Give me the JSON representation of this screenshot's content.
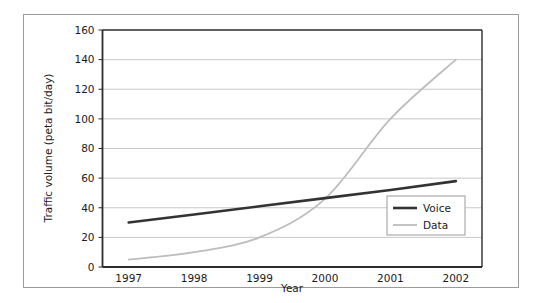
{
  "chart_data": {
    "type": "line",
    "title": "",
    "xlabel": "Year",
    "ylabel": "Traffic volume (peta bit/day)",
    "x": [
      1997,
      1998,
      1999,
      2000,
      2001,
      2002
    ],
    "xtick_labels": [
      "1997",
      "1998",
      "1999",
      "2000",
      "2001",
      "2002"
    ],
    "ytick_labels": [
      "0",
      "20",
      "40",
      "60",
      "80",
      "100",
      "120",
      "140",
      "160"
    ],
    "yticks": [
      0,
      20,
      40,
      60,
      80,
      100,
      120,
      140,
      160
    ],
    "ylim": [
      0,
      160
    ],
    "xlim": [
      1996.6,
      2002.4
    ],
    "grid": "horizontal",
    "legend_position": "lower-right-inside",
    "series": [
      {
        "name": "Voice",
        "color": "#333333",
        "width": 2.6,
        "values": [
          30,
          35.5,
          41,
          46.5,
          52,
          58
        ]
      },
      {
        "name": "Data",
        "color": "#bdbdbd",
        "width": 1.8,
        "values": [
          5,
          10,
          20,
          46,
          100,
          140
        ]
      }
    ]
  },
  "legend": {
    "entries": [
      {
        "label": "Voice"
      },
      {
        "label": "Data"
      }
    ]
  },
  "axes": {
    "x_title": "Year",
    "y_title": "Traffic volume (peta bit/day)"
  },
  "colors": {
    "voice": "#333333",
    "data": "#bdbdbd",
    "grid": "#c8c8c8",
    "axis": "#2b2b2b",
    "frame": "#9a9a9a"
  }
}
